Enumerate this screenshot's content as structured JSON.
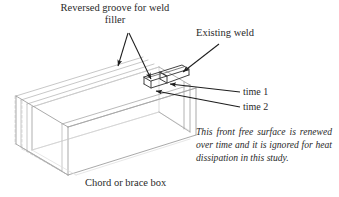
{
  "figure": {
    "type": "engineering-diagram"
  },
  "labels": {
    "reversed_groove": "Reversed groove for weld filler",
    "existing_weld": "Existing weld",
    "time_1": "time 1",
    "time_2": "time 2",
    "chord_or_brace_box": "Chord or brace box"
  },
  "notes": {
    "front_free_surface": "This front free surface is renewed over time and it is ignored for heat dissipation in this study."
  },
  "colors": {
    "text": "#2a2a2a",
    "outline_dark": "#3a3a3a",
    "outline_light": "#b9b9b9",
    "outline_faint": "#d8d8d8",
    "arrow": "#1e1e1e",
    "background": "#ffffff"
  },
  "geometry": {
    "box_open_top": true,
    "wall_thickness_shown": true,
    "hidden_lines_dashed": true,
    "groove_segments": 2
  }
}
